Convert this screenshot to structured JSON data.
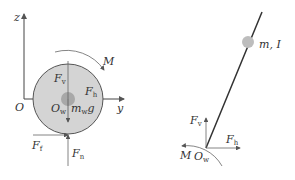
{
  "left_diagram": {
    "axis_z": "z",
    "axis_y": "y",
    "origin": "O",
    "moment": "M",
    "force_vertical": {
      "base": "F",
      "sub": "v"
    },
    "force_horizontal": {
      "base": "F",
      "sub": "h"
    },
    "wheel_center": {
      "base": "O",
      "sub": "w"
    },
    "weight": {
      "base": "m",
      "sub": "w",
      "tail": "g"
    },
    "friction": {
      "base": "F",
      "sub": "f"
    },
    "normal": {
      "base": "F",
      "sub": "n"
    }
  },
  "right_diagram": {
    "mass_label": "m, I",
    "force_vertical": {
      "base": "F",
      "sub": "v"
    },
    "force_horizontal": {
      "base": "F",
      "sub": "h"
    },
    "moment": "M",
    "pivot": {
      "base": "O",
      "sub": "w"
    }
  },
  "colors": {
    "wheel_fill": "#d4d4d4",
    "wheel_stroke": "#555555",
    "hub": "#a8a8a8",
    "line": "#333333",
    "mass": "#bdbdbd"
  }
}
